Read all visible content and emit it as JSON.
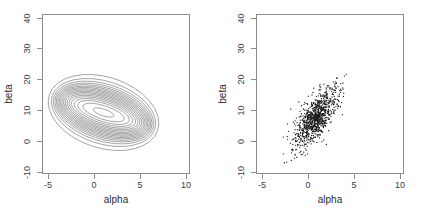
{
  "figure": {
    "panels": [
      {
        "id": "contour-panel",
        "kind": "contour",
        "xlabel": "alpha",
        "ylabel": "beta",
        "xticks": [
          "-5",
          "0",
          "5",
          "10"
        ],
        "yticks": [
          "-10",
          "0",
          "10",
          "20",
          "30",
          "40"
        ]
      },
      {
        "id": "scatter-panel",
        "kind": "scatter",
        "xlabel": "alpha",
        "ylabel": "beta",
        "xticks": [
          "-5",
          "0",
          "5",
          "10"
        ],
        "yticks": [
          "-10",
          "0",
          "10",
          "20",
          "30",
          "40"
        ]
      }
    ],
    "colors": {
      "axis": "#8c8c8c",
      "tick_label": "#3d3d3d",
      "axis_title": "#2b2b2b",
      "contour_line": "#808080",
      "point": "#1a1a1a",
      "background": "#ffffff"
    }
  },
  "chart_data": [
    {
      "type": "contour",
      "title": "",
      "xlabel": "alpha",
      "ylabel": "beta",
      "xlim": [
        -5,
        10
      ],
      "ylim": [
        -10,
        40
      ],
      "xticks": [
        -5,
        0,
        5,
        10
      ],
      "yticks": [
        -10,
        0,
        10,
        20,
        30,
        40
      ],
      "grid": false,
      "legend": "none",
      "description": "Concentric tilted elliptical contours of a bivariate density, centered near alpha = 1, beta = 8, elongated along a positively sloped axis.",
      "center": [
        1.0,
        8.0
      ],
      "sd": [
        1.4,
        4.6
      ],
      "correlation": 0.72,
      "rotation_deg": -72,
      "n_levels": 12,
      "outer_ellipse_semi_axes": [
        1.35,
        4.3
      ]
    },
    {
      "type": "scatter",
      "title": "",
      "xlabel": "alpha",
      "ylabel": "beta",
      "xlim": [
        -5,
        10
      ],
      "ylim": [
        -10,
        40
      ],
      "xticks": [
        -5,
        0,
        5,
        10
      ],
      "yticks": [
        -10,
        0,
        10,
        20,
        30,
        40
      ],
      "grid": false,
      "legend": "none",
      "description": "Dense cloud of simulated draws from the same bivariate density; points run from about alpha = -2.5 to 4 and beta = -7 to 23.",
      "n_points": 1000,
      "center": [
        1.0,
        8.0
      ],
      "sd": [
        1.1,
        4.6
      ],
      "correlation": 0.72,
      "x_range": [
        -2.6,
        4.1
      ],
      "y_range": [
        -7.0,
        23.0
      ],
      "marker": "point",
      "marker_size_px": 1.3
    }
  ]
}
